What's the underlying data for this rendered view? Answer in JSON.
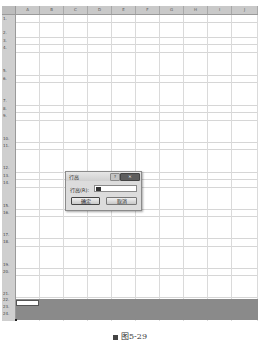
{
  "spreadsheet": {
    "columns": [
      "A",
      "B",
      "C",
      "D",
      "E",
      "F",
      "G",
      "H",
      "I",
      "J"
    ],
    "rows": [
      {
        "label": "1.",
        "top": 0,
        "h": 7
      },
      {
        "label": "2.",
        "top": 7,
        "h": 15
      },
      {
        "label": "3.",
        "top": 22,
        "h": 7
      },
      {
        "label": "4.",
        "top": 29,
        "h": 8
      },
      {
        "label": "5.",
        "top": 37,
        "h": 23
      },
      {
        "label": "6.",
        "top": 60,
        "h": 7
      },
      {
        "label": "7.",
        "top": 67,
        "h": 23
      },
      {
        "label": "8.",
        "top": 90,
        "h": 7
      },
      {
        "label": "9.",
        "top": 97,
        "h": 8
      },
      {
        "label": "10.",
        "top": 105,
        "h": 22
      },
      {
        "label": "11.",
        "top": 127,
        "h": 7
      },
      {
        "label": "12.",
        "top": 134,
        "h": 23
      },
      {
        "label": "13.",
        "top": 157,
        "h": 7
      },
      {
        "label": "14.",
        "top": 164,
        "h": 8
      },
      {
        "label": "15.",
        "top": 172,
        "h": 22
      },
      {
        "label": "16.",
        "top": 194,
        "h": 7
      },
      {
        "label": "17.",
        "top": 201,
        "h": 22
      },
      {
        "label": "18.",
        "top": 223,
        "h": 8
      },
      {
        "label": "19.",
        "top": 231,
        "h": 22
      },
      {
        "label": "20.",
        "top": 253,
        "h": 7
      },
      {
        "label": "21.",
        "top": 260,
        "h": 22
      },
      {
        "label": "22.",
        "top": 282,
        "h": 6
      },
      {
        "label": "23.",
        "top": 288,
        "h": 7
      },
      {
        "label": "24.",
        "top": 295,
        "h": 7
      }
    ],
    "active_cell": "A22",
    "selected_range": "A22:J24"
  },
  "dialog": {
    "title": "行高",
    "help_icon": "?",
    "close_icon": "✕",
    "row_height_label": "行高(R):",
    "row_height_value": "",
    "ok_label": "确定",
    "cancel_label": "取消"
  },
  "caption": {
    "text": "图5-29"
  }
}
